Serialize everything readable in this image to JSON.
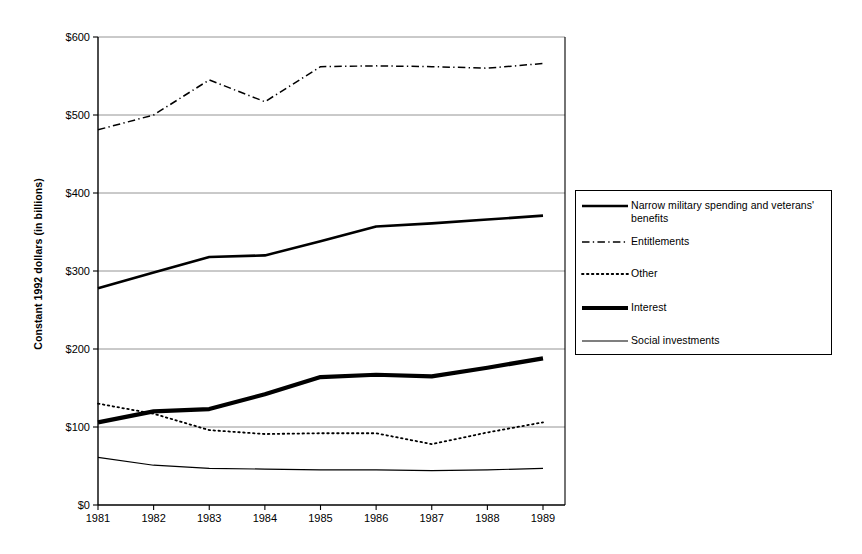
{
  "chart_data": {
    "type": "line",
    "title": "",
    "xlabel": "",
    "ylabel": "Constant 1992 dollars (in billions)",
    "x": [
      1981,
      1982,
      1983,
      1984,
      1985,
      1986,
      1987,
      1988,
      1989
    ],
    "categories": [
      "1981",
      "1982",
      "1983",
      "1984",
      "1985",
      "1986",
      "1987",
      "1988",
      "1989"
    ],
    "xtick_labels": [
      "1981",
      "1982",
      "1983",
      "1984",
      "1985",
      "1986",
      "1987",
      "1988",
      "1989"
    ],
    "ytick_labels": [
      "$600",
      "$500",
      "$400",
      "$300",
      "$200",
      "$100",
      "$0"
    ],
    "ytick_values": [
      600,
      500,
      400,
      300,
      200,
      100,
      0
    ],
    "ylim": [
      0,
      600
    ],
    "grid": "horizontal",
    "legend_position": "right",
    "series": [
      {
        "name": "Narrow military spending and veterans' benefits",
        "style": "solid",
        "width": 2.6,
        "color": "#000000",
        "values": [
          278,
          298,
          318,
          320,
          338,
          357,
          361,
          366,
          371
        ]
      },
      {
        "name": "Entitlements",
        "style": "dashdot",
        "width": 1.5,
        "color": "#000000",
        "values": [
          481,
          500,
          545,
          517,
          562,
          563,
          562,
          560,
          566
        ]
      },
      {
        "name": "Other",
        "style": "dotted",
        "width": 1.8,
        "color": "#000000",
        "values": [
          130,
          117,
          96,
          91,
          92,
          92,
          78,
          93,
          106
        ]
      },
      {
        "name": "Interest",
        "style": "solid",
        "width": 4.2,
        "color": "#000000",
        "values": [
          106,
          120,
          123,
          142,
          164,
          167,
          165,
          176,
          188
        ]
      },
      {
        "name": "Social investments",
        "style": "solid",
        "width": 1.2,
        "color": "#000000",
        "values": [
          61,
          51,
          47,
          46,
          45,
          45,
          44,
          45,
          47
        ]
      }
    ]
  },
  "axis": {
    "y_title": "Constant 1992 dollars (in billions)"
  },
  "legend": {
    "entries": [
      {
        "label": "Narrow military spending and veterans' benefits",
        "style": "solid",
        "width": 2.6
      },
      {
        "label": "Entitlements",
        "style": "dashdot",
        "width": 1.5
      },
      {
        "label": "Other",
        "style": "dotted",
        "width": 1.8
      },
      {
        "label": "Interest",
        "style": "solid",
        "width": 4.2
      },
      {
        "label": "Social investments",
        "style": "solid",
        "width": 1.2
      }
    ]
  },
  "colors": {
    "ink": "#000000",
    "grid": "#7a7a7a",
    "background": "#ffffff"
  }
}
